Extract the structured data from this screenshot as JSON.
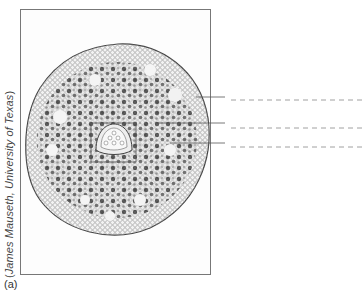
{
  "figure": {
    "panel_label": "(a)",
    "credit_open": "(",
    "credit_text": "James Mauseth, University of Texas",
    "credit_close": ")",
    "label_lines": [
      {
        "id": "label-line-1",
        "blank": true
      },
      {
        "id": "label-line-2",
        "blank": true
      },
      {
        "id": "label-line-3",
        "blank": true
      }
    ]
  },
  "colors": {
    "frame": "#777777",
    "line": "#555555",
    "dash": "#888888",
    "text": "#444444"
  }
}
